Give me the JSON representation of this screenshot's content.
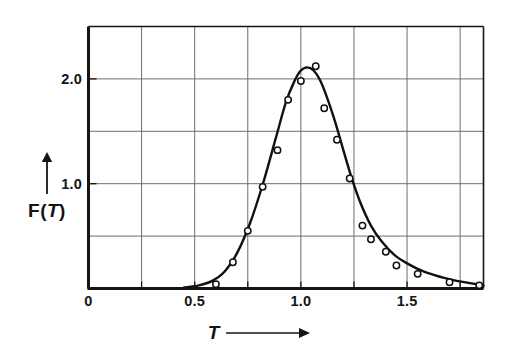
{
  "chart_data": {
    "type": "scatter",
    "title": "",
    "subtitle": "",
    "xlabel": "T",
    "ylabel": "F(T)",
    "xlabel_suffix": "arrow-right",
    "ylabel_prefix": "arrow-up",
    "xlim": [
      0,
      1.86
    ],
    "ylim": [
      0,
      2.5
    ],
    "xticks": [
      0,
      0.5,
      1.0,
      1.5
    ],
    "xticklabels": [
      "0",
      "0.5",
      "1.0",
      "1.5"
    ],
    "yticks": [
      1.0,
      2.0
    ],
    "yticklabels": [
      "1.0",
      "2.0"
    ],
    "minor_xticks": [
      0.25,
      0.75,
      1.25,
      1.75
    ],
    "grid": true,
    "grid_x": [
      0.25,
      0.5,
      0.75,
      1.0,
      1.25,
      1.5,
      1.75
    ],
    "grid_y": [
      0.5,
      1.0,
      1.5,
      2.0
    ],
    "legend": null,
    "marker": "open-circle",
    "series": [
      {
        "name": "F(T) measured",
        "marker": "open-circle",
        "x": [
          0.6,
          0.68,
          0.75,
          0.82,
          0.89,
          0.94,
          1.0,
          1.07,
          1.11,
          1.17,
          1.23,
          1.29,
          1.33,
          1.4,
          1.45,
          1.55,
          1.7,
          1.84
        ],
        "y": [
          0.04,
          0.25,
          0.55,
          0.97,
          1.32,
          1.8,
          1.98,
          2.12,
          1.72,
          1.42,
          1.05,
          0.6,
          0.47,
          0.35,
          0.22,
          0.14,
          0.06,
          0.03
        ]
      },
      {
        "name": "F(T) fitted curve",
        "marker": "none",
        "curve": true,
        "x": [
          0.45,
          0.52,
          0.58,
          0.64,
          0.7,
          0.76,
          0.82,
          0.88,
          0.93,
          0.97,
          1.0,
          1.03,
          1.06,
          1.09,
          1.12,
          1.16,
          1.2,
          1.24,
          1.28,
          1.33,
          1.38,
          1.44,
          1.5,
          1.58,
          1.66,
          1.74,
          1.86
        ],
        "y": [
          0.01,
          0.03,
          0.07,
          0.16,
          0.34,
          0.62,
          0.99,
          1.42,
          1.78,
          1.98,
          2.08,
          2.11,
          2.08,
          1.99,
          1.84,
          1.6,
          1.32,
          1.05,
          0.82,
          0.6,
          0.45,
          0.32,
          0.24,
          0.16,
          0.11,
          0.07,
          0.03
        ]
      }
    ]
  },
  "axes": {
    "frame_color": "#141414",
    "grid_color": "#6e6e6e",
    "data_color": "#111111",
    "background": "#ffffff"
  }
}
